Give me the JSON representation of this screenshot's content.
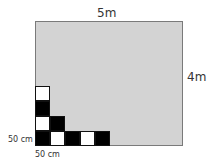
{
  "diagram": {
    "width_label": "5m",
    "height_label": "4m",
    "tile_height_label": "50 cm",
    "tile_width_label": "50 cm",
    "colors": {
      "floor": "#d3d3d3",
      "tile_black": "#000000",
      "tile_white": "#ffffff"
    },
    "tiles": [
      {
        "row": 0,
        "col": 0,
        "color": "black"
      },
      {
        "row": 0,
        "col": 1,
        "color": "white"
      },
      {
        "row": 0,
        "col": 2,
        "color": "black"
      },
      {
        "row": 0,
        "col": 3,
        "color": "white"
      },
      {
        "row": 0,
        "col": 4,
        "color": "black"
      },
      {
        "row": 1,
        "col": 0,
        "color": "white"
      },
      {
        "row": 1,
        "col": 1,
        "color": "black"
      },
      {
        "row": 2,
        "col": 0,
        "color": "black"
      },
      {
        "row": 3,
        "col": 0,
        "color": "white"
      }
    ]
  }
}
